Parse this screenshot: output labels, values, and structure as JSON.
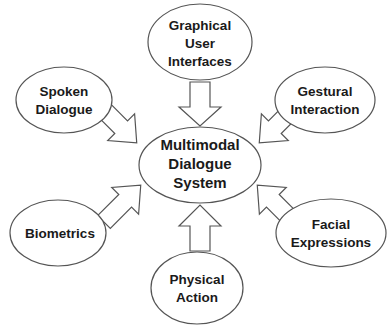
{
  "diagram": {
    "title": "Multimodal Dialogue System",
    "colors": {
      "background": "#ffffff",
      "stroke": "#555555",
      "text": "#1a1a1a"
    },
    "center": {
      "id": "multimodal-dialogue-system",
      "lines": [
        "Multimodal",
        "Dialogue",
        "System"
      ]
    },
    "nodes": [
      {
        "id": "graphical-user-interfaces",
        "lines": [
          "Graphical",
          "User",
          "Interfaces"
        ]
      },
      {
        "id": "spoken-dialogue",
        "lines": [
          "Spoken",
          "Dialogue"
        ]
      },
      {
        "id": "gestural-interaction",
        "lines": [
          "Gestural",
          "Interaction"
        ]
      },
      {
        "id": "biometrics",
        "lines": [
          "Biometrics"
        ]
      },
      {
        "id": "facial-expressions",
        "lines": [
          "Facial",
          "Expressions"
        ]
      },
      {
        "id": "physical-action",
        "lines": [
          "Physical",
          "Action"
        ]
      }
    ],
    "edges": [
      {
        "from": "graphical-user-interfaces",
        "to": "multimodal-dialogue-system",
        "style": "block-arrow"
      },
      {
        "from": "spoken-dialogue",
        "to": "multimodal-dialogue-system",
        "style": "block-arrow"
      },
      {
        "from": "gestural-interaction",
        "to": "multimodal-dialogue-system",
        "style": "block-arrow"
      },
      {
        "from": "biometrics",
        "to": "multimodal-dialogue-system",
        "style": "block-arrow"
      },
      {
        "from": "facial-expressions",
        "to": "multimodal-dialogue-system",
        "style": "block-arrow"
      },
      {
        "from": "physical-action",
        "to": "multimodal-dialogue-system",
        "style": "block-arrow"
      }
    ]
  }
}
